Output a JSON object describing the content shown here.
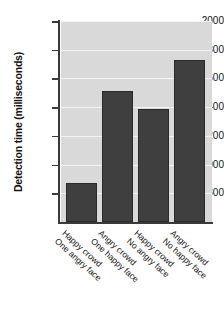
{
  "chart_data": {
    "type": "bar",
    "title": "",
    "subtitle": "",
    "xlabel": "",
    "ylabel": "Detection time (milliseconds)",
    "ylim": [
      600,
      2000
    ],
    "yticks": [
      800,
      1000,
      1200,
      1400,
      1600,
      1800,
      2000
    ],
    "ytick_labels": [
      "800",
      "1000",
      "1200",
      "1400",
      "1600",
      "1800",
      "2000"
    ],
    "grid": "horizontal-white",
    "legend": "none",
    "categories": [
      "Happy crowd One angry face",
      "Angry crowd One happy face",
      "Happy crowd No angry face",
      "Angry crowd No happy face"
    ],
    "category_lines": [
      [
        "Happy crowd",
        "One angry face"
      ],
      [
        "Angry crowd",
        "One happy face"
      ],
      [
        "Happy crowd",
        "No angry face"
      ],
      [
        "Angry crowd",
        "No happy face"
      ]
    ],
    "values": [
      875,
      1510,
      1390,
      1730
    ],
    "units": "milliseconds",
    "colors": {
      "bar_fill": "#3f3f3f",
      "bar_stroke": "#2a2a2a",
      "plot_background": "#d9d9d9",
      "gridline": "#f4f4f4",
      "axis": "#3a3a3a",
      "text": "#141414",
      "page_background": "#ffffff"
    }
  }
}
